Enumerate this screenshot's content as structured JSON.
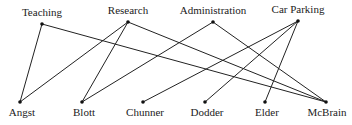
{
  "top_nodes": [
    {
      "id": "teaching",
      "label": "Teaching",
      "x": 42,
      "y": 24
    },
    {
      "id": "research",
      "label": "Research",
      "x": 128,
      "y": 22
    },
    {
      "id": "administration",
      "label": "Administration",
      "x": 213,
      "y": 22
    },
    {
      "id": "car_parking",
      "label": "Car Parking",
      "x": 298,
      "y": 21
    }
  ],
  "bottom_nodes": [
    {
      "id": "angst",
      "label": "Angst",
      "x": 20,
      "y": 102
    },
    {
      "id": "blott",
      "label": "Blott",
      "x": 82,
      "y": 102
    },
    {
      "id": "chunner",
      "label": "Chunner",
      "x": 143,
      "y": 102
    },
    {
      "id": "dodder",
      "label": "Dodder",
      "x": 205,
      "y": 102
    },
    {
      "id": "elder",
      "label": "Elder",
      "x": 265,
      "y": 102
    },
    {
      "id": "mcbrain",
      "label": "McBrain",
      "x": 326,
      "y": 102
    }
  ],
  "edges": [
    [
      "teaching",
      "angst"
    ],
    [
      "teaching",
      "mcbrain"
    ],
    [
      "research",
      "angst"
    ],
    [
      "research",
      "blott"
    ],
    [
      "research",
      "mcbrain"
    ],
    [
      "administration",
      "blott"
    ],
    [
      "administration",
      "mcbrain"
    ],
    [
      "car_parking",
      "chunner"
    ],
    [
      "car_parking",
      "dodder"
    ],
    [
      "car_parking",
      "elder"
    ]
  ],
  "style": {
    "line_color": "#222222",
    "node_color": "#111111"
  }
}
